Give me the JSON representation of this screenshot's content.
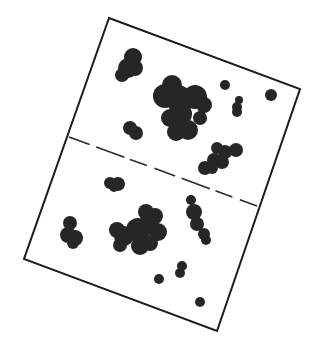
{
  "diagram": {
    "colors": {
      "ink": "#262626",
      "outline": "#1c1c1c",
      "paper": "#ffffff"
    },
    "sheet": {
      "corners": [
        [
          109,
          18
        ],
        [
          300,
          89
        ],
        [
          217,
          331
        ],
        [
          24,
          259
        ]
      ]
    },
    "fold_line": {
      "from": [
        69,
        137
      ],
      "to": [
        257,
        206
      ],
      "style": "dashed",
      "dash": "22 7 30 6 18 8"
    },
    "blobs": [
      {
        "name": "top-left-blob",
        "circles": [
          [
            133,
            57,
            9
          ],
          [
            128,
            68,
            10
          ],
          [
            122,
            75,
            7
          ],
          [
            135,
            68,
            8
          ]
        ]
      },
      {
        "name": "center-large-blob",
        "circles": [
          [
            172,
            85,
            10
          ],
          [
            165,
            96,
            12
          ],
          [
            178,
            98,
            13
          ],
          [
            195,
            97,
            12
          ],
          [
            204,
            105,
            8
          ],
          [
            180,
            114,
            12
          ],
          [
            170,
            118,
            9
          ],
          [
            188,
            130,
            10
          ],
          [
            176,
            132,
            9
          ],
          [
            200,
            118,
            7
          ]
        ]
      },
      {
        "name": "small-dot-upper",
        "circles": [
          [
            225,
            85,
            5
          ]
        ]
      },
      {
        "name": "right-dot-upper",
        "circles": [
          [
            271,
            95,
            6
          ]
        ]
      },
      {
        "name": "right-pill-upper",
        "circles": [
          [
            239,
            100,
            4
          ],
          [
            237,
            107,
            5
          ],
          [
            237,
            112,
            5
          ]
        ]
      },
      {
        "name": "left-mid-blob",
        "circles": [
          [
            130,
            128,
            7
          ],
          [
            136,
            133,
            7
          ]
        ]
      },
      {
        "name": "lower-right-top-blob",
        "circles": [
          [
            217,
            148,
            6
          ],
          [
            225,
            152,
            7
          ],
          [
            236,
            150,
            7
          ],
          [
            214,
            160,
            7
          ],
          [
            205,
            168,
            7
          ],
          [
            222,
            162,
            7
          ],
          [
            212,
            168,
            6
          ]
        ]
      },
      {
        "name": "small-blob-below-fold",
        "circles": [
          [
            110,
            183,
            6
          ],
          [
            118,
            184,
            7
          ],
          [
            114,
            187,
            5
          ]
        ]
      },
      {
        "name": "left-lower-blob",
        "circles": [
          [
            70,
            223,
            7
          ],
          [
            68,
            235,
            8
          ],
          [
            75,
            238,
            8
          ],
          [
            73,
            243,
            6
          ]
        ]
      },
      {
        "name": "center-lower-blob",
        "circles": [
          [
            146,
            212,
            8
          ],
          [
            155,
            216,
            8
          ],
          [
            117,
            230,
            8
          ],
          [
            124,
            236,
            10
          ],
          [
            138,
            230,
            12
          ],
          [
            148,
            225,
            10
          ],
          [
            158,
            232,
            9
          ],
          [
            120,
            245,
            7
          ],
          [
            140,
            246,
            9
          ],
          [
            150,
            243,
            8
          ]
        ]
      },
      {
        "name": "right-lower-blob",
        "circles": [
          [
            191,
            200,
            5
          ],
          [
            194,
            212,
            8
          ],
          [
            197,
            224,
            7
          ],
          [
            204,
            234,
            6
          ],
          [
            206,
            240,
            5
          ]
        ]
      },
      {
        "name": "small-dot-bottom-left",
        "circles": [
          [
            159,
            279,
            5
          ]
        ]
      },
      {
        "name": "pill-bottom",
        "circles": [
          [
            182,
            266,
            5
          ],
          [
            180,
            273,
            5
          ]
        ]
      },
      {
        "name": "small-dot-bottom-right",
        "circles": [
          [
            200,
            302,
            5
          ]
        ]
      }
    ]
  }
}
